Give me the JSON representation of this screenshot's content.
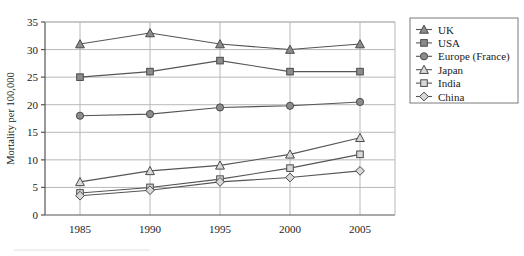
{
  "chart_data": {
    "type": "line",
    "title": "",
    "xlabel": "",
    "ylabel": "Mortality per 100,000",
    "x": [
      1985,
      1990,
      1995,
      2000,
      2005
    ],
    "xtick_labels": [
      "1985",
      "1990",
      "1995",
      "2000",
      "2005"
    ],
    "ytick_labels": [
      "0",
      "5",
      "10",
      "15",
      "20",
      "25",
      "30",
      "35"
    ],
    "yticks": [
      0,
      5,
      10,
      15,
      20,
      25,
      30,
      35
    ],
    "ylim": [
      0,
      35
    ],
    "xlim": [
      1982.5,
      2007.5
    ],
    "grid": "horizontal-and-vertical",
    "legend_position": "right-outside",
    "series": [
      {
        "name": "UK",
        "marker": "filled-triangle",
        "values": [
          31,
          33,
          31,
          30,
          31
        ],
        "color": "#8c8c8c"
      },
      {
        "name": "USA",
        "marker": "filled-square",
        "values": [
          25,
          26,
          28,
          26,
          26
        ],
        "color": "#8c8c8c"
      },
      {
        "name": "Europe (France)",
        "marker": "filled-circle",
        "values": [
          18,
          18.3,
          19.5,
          19.8,
          20.5
        ],
        "color": "#8c8c8c"
      },
      {
        "name": "Japan",
        "marker": "open-triangle",
        "values": [
          6,
          8,
          9,
          11,
          14
        ],
        "color": "#cfcfcf"
      },
      {
        "name": "India",
        "marker": "open-square",
        "values": [
          4,
          5,
          6.5,
          8.5,
          11
        ],
        "color": "#cfcfcf"
      },
      {
        "name": "China",
        "marker": "open-diamond",
        "values": [
          3.5,
          4.5,
          6,
          6.8,
          8
        ],
        "color": "#cfcfcf"
      }
    ]
  },
  "axes": {
    "y_title": "Mortality per 100,000"
  },
  "legend": {
    "items": [
      {
        "label": "UK"
      },
      {
        "label": "USA"
      },
      {
        "label": "Europe (France)"
      },
      {
        "label": "Japan"
      },
      {
        "label": "India"
      },
      {
        "label": "China"
      }
    ]
  },
  "colors": {
    "line": "#555555",
    "grid": "#b8b8b8",
    "axis": "#555555",
    "marker_fill_solid": "#8c8c8c",
    "marker_fill_open": "#d8d8d8",
    "marker_stroke": "#4a4a4a",
    "legend_border": "#7a7a7a",
    "text": "#1a1a1a"
  }
}
